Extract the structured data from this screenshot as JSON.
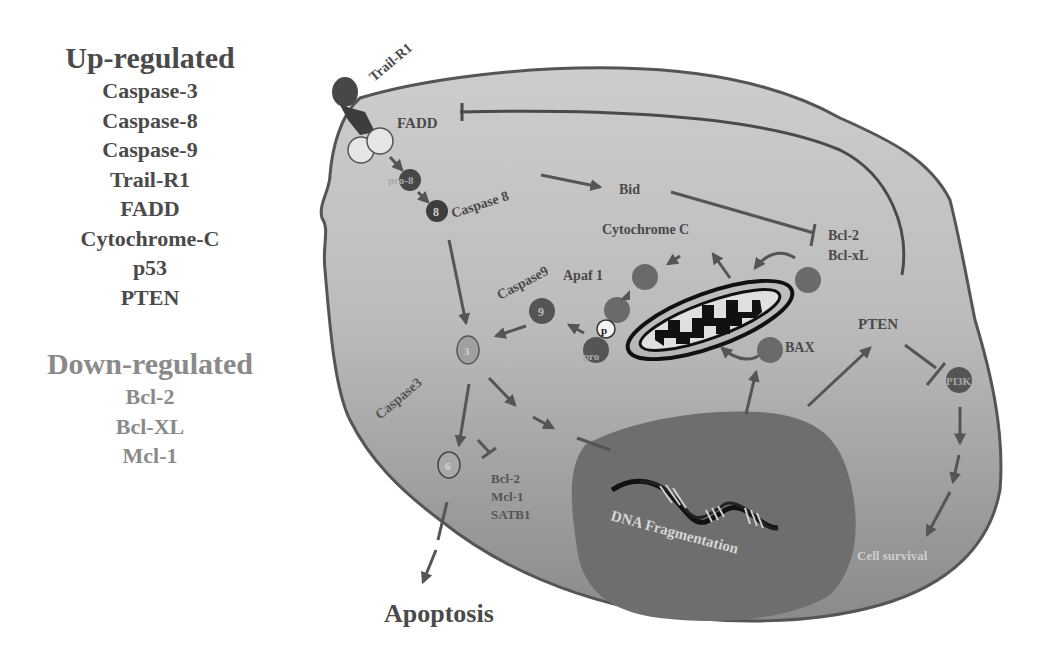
{
  "legend": {
    "up_title": "Up-regulated",
    "up_items": [
      "Caspase-3",
      "Caspase-8",
      "Caspase-9",
      "Trail-R1",
      "FADD",
      "Cytochrome-C",
      "p53",
      "PTEN"
    ],
    "down_title": "Down-regulated",
    "down_items": [
      "Bcl-2",
      "Bcl-XL",
      "Mcl-1"
    ]
  },
  "diagram": {
    "receptor": "Trail-R1",
    "adaptor": "FADD",
    "pro_caspase8": "pro-8",
    "caspase8_node": "8",
    "caspase8_label": "Caspase 8",
    "bid": "Bid",
    "cytochrome_c": "Cytochrome C",
    "bcl2_top": "Bcl-2",
    "bclxl_top": "Bcl-xL",
    "apaf1": "Apaf 1",
    "caspase9_label": "Caspase9",
    "caspase9_node": "9",
    "p_label": "p",
    "pro_caspase9": "pro",
    "bax": "BAX",
    "pten": "PTEN",
    "pi3k": "PI3K",
    "caspase3_node": "3",
    "caspase3_label": "Caspase3",
    "caspase6_node": "6",
    "inhibited_bottom": [
      "Bcl-2",
      "Mcl-1",
      "SATB1"
    ],
    "dna": "DNA Fragmentation",
    "cell_survival": "Cell survival",
    "apoptosis": "Apoptosis"
  },
  "colors": {
    "cytoplasm": "#c4c4c4",
    "cytoplasm_dark": "#8e8e8e",
    "nucleus": "#6e6e6e",
    "outline": "#555555",
    "node_dark": "#474747",
    "node_mid": "#6a6a6a",
    "arrow": "#5a5a5a",
    "text_dark": "#4a4a4a",
    "text_light": "#cfcfcf"
  }
}
